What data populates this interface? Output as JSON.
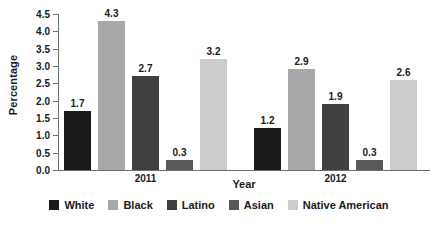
{
  "chart_data": {
    "type": "bar",
    "title": "",
    "subtitle": "",
    "xlabel": "Year",
    "ylabel": "Percentage",
    "categories": [
      "2011",
      "2012"
    ],
    "series": [
      {
        "name": "White",
        "color": "#1a1a1a",
        "values": [
          1.7,
          1.2
        ]
      },
      {
        "name": "Black",
        "color": "#a8a8a8",
        "values": [
          4.3,
          2.9
        ]
      },
      {
        "name": "Latino",
        "color": "#404040",
        "values": [
          2.7,
          1.9
        ]
      },
      {
        "name": "Asian",
        "color": "#595959",
        "values": [
          0.3,
          0.3
        ]
      },
      {
        "name": "Native American",
        "color": "#cccccc",
        "values": [
          3.2,
          2.6
        ]
      }
    ],
    "data_labels": [
      [
        "1.7",
        "4.3",
        "2.7",
        "0.3",
        "3.2"
      ],
      [
        "1.2",
        "2.9",
        "1.9",
        "0.3",
        "2.6"
      ]
    ],
    "ylim": [
      0.0,
      4.5
    ],
    "ytick_values": [
      0.0,
      0.5,
      1.0,
      1.5,
      2.0,
      2.5,
      3.0,
      3.5,
      4.0,
      4.5
    ],
    "ytick_labels": [
      "0.0",
      "0.5",
      "1.0",
      "1.5",
      "2.0",
      "2.5",
      "3.0",
      "3.5",
      "4.0",
      "4.5"
    ],
    "grid": false,
    "legend_position": "bottom",
    "axis_color": "#6e6e6e",
    "text_color": "#1a1a1a",
    "background": "#ffffff"
  }
}
